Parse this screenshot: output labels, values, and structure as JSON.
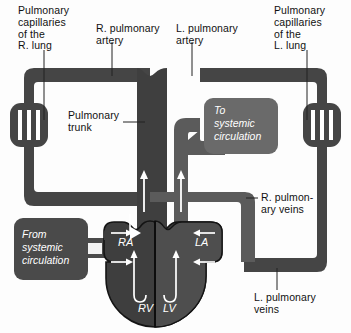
{
  "figure": {
    "colors": {
      "vessel_dark": "#454545",
      "vessel_mid": "#5b5b5b",
      "heart_left": "#4a4a4a",
      "heart_right": "#3e3e3e",
      "box_fill": "#6a6a6a",
      "outline": "#1a1a1a",
      "arrow_white": "#ffffff",
      "background": "#fdfdfd",
      "text": "#111111"
    }
  },
  "labels": {
    "pulmonary_capillaries_right": "Pulmonary\ncapillaries\nof the\nR. lung",
    "r_pulmonary_artery": "R. pulmonary\nartery",
    "l_pulmonary_artery": "L. pulmonary\nartery",
    "pulmonary_capillaries_left": "Pulmonary\ncapillaries\nof the\nL. lung",
    "pulmonary_trunk": "Pulmonary\ntrunk",
    "r_pulmonary_veins": "R. pulmon-\nary veins",
    "l_pulmonary_veins": "L. pulmonary\nveins"
  },
  "boxes": {
    "to_systemic": "To\nsystemic\ncirculation",
    "to_systemic_lines": [
      "To",
      "systemic",
      "circulation"
    ],
    "from_systemic": "From\nsystemic\ncirculation",
    "from_systemic_lines": [
      "From",
      "systemic",
      "circulation"
    ]
  },
  "chambers": {
    "right_atrium": "RA",
    "left_atrium": "LA",
    "right_ventricle": "RV",
    "left_ventricle": "LV"
  },
  "flow_arrows": {
    "ra_inflow_count": 2,
    "la_inflow_count": 2,
    "ventricle_outflow_count": 2,
    "direction_right_side": "into-left-atrium",
    "direction_left_side": "into-right-atrium"
  }
}
